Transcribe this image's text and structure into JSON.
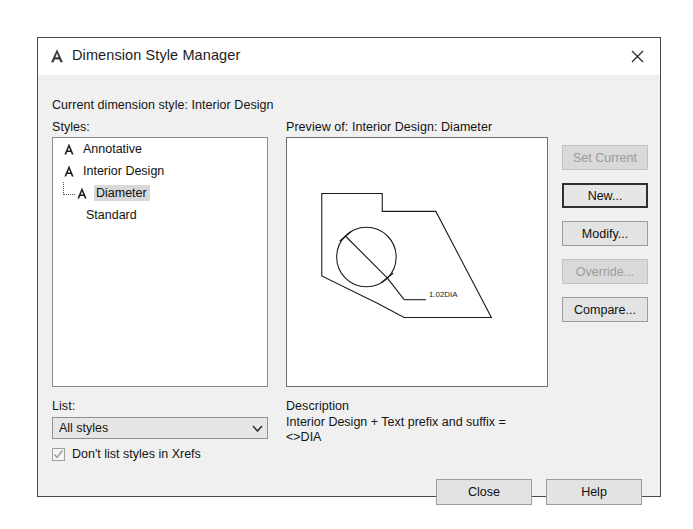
{
  "dialog": {
    "title": "Dimension Style Manager",
    "icon": "autocad-a-icon",
    "close_icon": "close-icon",
    "current_style_line": "Current dimension style: Interior Design"
  },
  "styles_group": {
    "label": "Styles:",
    "items": [
      {
        "label": "Annotative",
        "level": 0,
        "icon": "dimension-style-icon",
        "selected": false
      },
      {
        "label": "Interior Design",
        "level": 0,
        "icon": "dimension-style-icon",
        "selected": false
      },
      {
        "label": "Diameter",
        "level": 1,
        "icon": "dimension-style-icon",
        "selected": true
      },
      {
        "label": "Standard",
        "level": 0,
        "icon": "none",
        "selected": false
      }
    ]
  },
  "preview": {
    "label": "Preview of: Interior Design: Diameter",
    "dimension_text": "1.02DIA"
  },
  "description": {
    "label": "Description",
    "text": "Interior Design + Text prefix and suffix =\n<>DIA"
  },
  "list_filter": {
    "label": "List:",
    "value": "All styles",
    "arrow_icon": "chevron-down-icon"
  },
  "xrefs": {
    "label": "Don't list styles in Xrefs",
    "checked": true,
    "check_icon": "check-icon"
  },
  "side_buttons": [
    {
      "label": "Set Current",
      "state": "disabled"
    },
    {
      "label": "New...",
      "state": "focused"
    },
    {
      "label": "Modify...",
      "state": "enabled"
    },
    {
      "label": "Override...",
      "state": "disabled"
    },
    {
      "label": "Compare...",
      "state": "enabled"
    }
  ],
  "bottom_buttons": {
    "close": "Close",
    "help": "Help"
  },
  "colors": {
    "dialog_background": "#f0f0f0",
    "titlebar_background": "#ffffff",
    "field_background": "#ffffff",
    "button_face": "#e3e3e3",
    "disabled_text": "#9a9a9a",
    "selection": "#d8d8d8",
    "line": "#1a1a1a"
  }
}
